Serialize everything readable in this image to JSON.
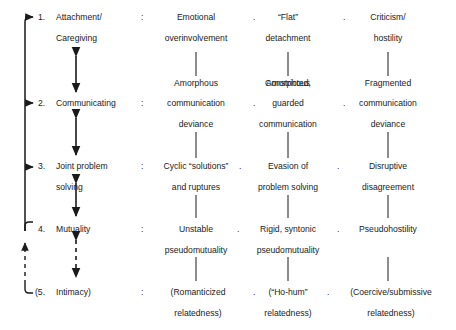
{
  "figure": {
    "background_color": "#ffffff",
    "ink_color": "#1a1a1a"
  },
  "separators": {
    "colon": ":",
    "dot": "."
  },
  "rows": [
    {
      "number": "1.",
      "dimension_line1": "Attachment/",
      "dimension_line2": "Caregiving",
      "colon": ":",
      "columns": [
        {
          "line1": "Emotional",
          "line2": "overinvolvement"
        },
        {
          "line1": "“Flat”",
          "line2": "detachment"
        },
        {
          "line1": "Criticism/",
          "line2": "hostility"
        }
      ]
    },
    {
      "number": "2.",
      "dimension_line1": "Communicating",
      "dimension_line2": "",
      "colon": ":",
      "columns": [
        {
          "line1": "Amorphous",
          "line2": "communication",
          "line3": "deviance"
        },
        {
          "line1": "Constricted,",
          "line2": "guarded",
          "line3": "communication"
        },
        {
          "line1": "Fragmented",
          "line2": "communication",
          "line3": "deviance"
        }
      ]
    },
    {
      "number": "3.",
      "dimension_line1": "Joint problem",
      "dimension_line2": "solving",
      "colon": ":",
      "columns": [
        {
          "line1": "Cyclic “solutions”",
          "line2": "and ruptures"
        },
        {
          "line1": "Evasion of",
          "line2": "problem solving"
        },
        {
          "line1": "Disruptive",
          "line2": "disagreement"
        }
      ]
    },
    {
      "number": "4.",
      "dimension_line1": "Mutuality",
      "dimension_line2": "",
      "colon": ":",
      "columns": [
        {
          "line1": "Unstable",
          "line2": "pseudomutuality"
        },
        {
          "line1": "Rigid, syntonic",
          "line2": "pseudomutuality"
        },
        {
          "line1": "Pseudohostility",
          "line2": ""
        }
      ]
    },
    {
      "number": "(5.",
      "dimension_line1": "Intimacy)",
      "dimension_line2": "",
      "colon": ":",
      "columns": [
        {
          "line1": "(Romanticized",
          "line2": "relatedness)"
        },
        {
          "line1": "(“Ho-hum”",
          "line2": "relatedness)"
        },
        {
          "line1": "(Coercive/submissive",
          "line2": "relatedness)"
        }
      ]
    }
  ],
  "connectors": {
    "between_rows": [
      {
        "from": "1",
        "to": "2",
        "style": "solid",
        "type": "double-headed-arrow"
      },
      {
        "from": "2",
        "to": "3",
        "style": "solid",
        "type": "double-headed-arrow"
      },
      {
        "from": "3",
        "to": "4",
        "style": "solid",
        "type": "double-headed-arrow"
      },
      {
        "from": "4",
        "to": "5",
        "style": "dashed",
        "type": "double-headed-arrow"
      }
    ],
    "left_bracket": {
      "style": "solid",
      "arrow_targets": [
        "1",
        "2",
        "3"
      ],
      "origin": "4"
    },
    "left_dashed": {
      "style": "dashed",
      "origin": "5",
      "arrow_target": "4"
    }
  }
}
